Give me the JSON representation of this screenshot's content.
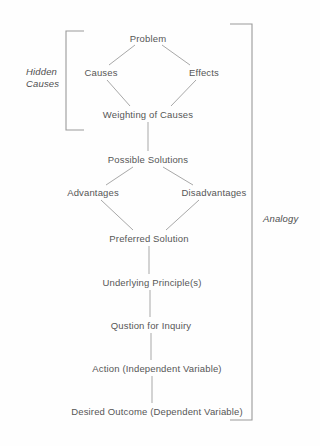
{
  "diagram": {
    "type": "flow-diagram",
    "canvas": {
      "width": 320,
      "height": 446,
      "background": "#fefefe"
    },
    "style": {
      "line_color": "#a8a8a8",
      "bracket_color": "#9a9a9a",
      "text_color": "#565656",
      "group_label_color": "#4f4f4f"
    },
    "nodes": [
      {
        "id": "problem",
        "label": "Problem",
        "x": 148,
        "y": 38
      },
      {
        "id": "causes",
        "label": "Causes",
        "x": 101,
        "y": 72
      },
      {
        "id": "effects",
        "label": "Effects",
        "x": 204,
        "y": 72
      },
      {
        "id": "weighting",
        "label": "Weighting of Causes",
        "x": 148,
        "y": 114
      },
      {
        "id": "possible",
        "label": "Possible Solutions",
        "x": 148,
        "y": 159
      },
      {
        "id": "advantages",
        "label": "Advantages",
        "x": 93,
        "y": 192
      },
      {
        "id": "disadvantages",
        "label": "Disadvantages",
        "x": 214,
        "y": 192
      },
      {
        "id": "preferred",
        "label": "Preferred Solution",
        "x": 149,
        "y": 238
      },
      {
        "id": "underlying",
        "label": "Underlying Principle(s)",
        "x": 152,
        "y": 282
      },
      {
        "id": "question",
        "label": "Qustion for Inquiry",
        "x": 151,
        "y": 325
      },
      {
        "id": "action",
        "label": "Action (Independent Variable)",
        "x": 157,
        "y": 368
      },
      {
        "id": "outcome",
        "label": "Desired Outcome (Dependent Variable)",
        "x": 157,
        "y": 411
      }
    ],
    "connectors": [
      {
        "from": "problem",
        "to": "causes",
        "x1": 135,
        "y1": 45,
        "x2": 109,
        "y2": 65
      },
      {
        "from": "problem",
        "to": "effects",
        "x1": 162,
        "y1": 45,
        "x2": 190,
        "y2": 65
      },
      {
        "from": "causes",
        "to": "weighting",
        "x1": 107,
        "y1": 80,
        "x2": 130,
        "y2": 106
      },
      {
        "from": "effects",
        "to": "weighting",
        "x1": 196,
        "y1": 80,
        "x2": 171,
        "y2": 106
      },
      {
        "from": "weighting",
        "to": "possible",
        "x1": 148,
        "y1": 122,
        "x2": 148,
        "y2": 151
      },
      {
        "from": "possible",
        "to": "advantages",
        "x1": 133,
        "y1": 167,
        "x2": 106,
        "y2": 185
      },
      {
        "from": "possible",
        "to": "disadvantages",
        "x1": 163,
        "y1": 167,
        "x2": 193,
        "y2": 185
      },
      {
        "from": "advantages",
        "to": "preferred",
        "x1": 101,
        "y1": 200,
        "x2": 133,
        "y2": 230
      },
      {
        "from": "disadvantages",
        "to": "preferred",
        "x1": 199,
        "y1": 200,
        "x2": 166,
        "y2": 230
      },
      {
        "from": "preferred",
        "to": "underlying",
        "x1": 149,
        "y1": 246,
        "x2": 149,
        "y2": 274
      },
      {
        "from": "underlying",
        "to": "question",
        "x1": 150,
        "y1": 290,
        "x2": 150,
        "y2": 317
      },
      {
        "from": "question",
        "to": "action",
        "x1": 151,
        "y1": 333,
        "x2": 151,
        "y2": 360
      },
      {
        "from": "action",
        "to": "outcome",
        "x1": 152,
        "y1": 376,
        "x2": 152,
        "y2": 403
      }
    ],
    "brackets": [
      {
        "id": "hidden-causes-bracket",
        "orientation": "left",
        "spine_x": 66,
        "top_y": 31,
        "bottom_y": 130,
        "arm_length": 18
      },
      {
        "id": "analogy-bracket",
        "orientation": "right",
        "spine_x": 252,
        "top_y": 24,
        "bottom_y": 420,
        "arm_length": 22
      }
    ],
    "group_labels": [
      {
        "id": "hidden-causes",
        "lines": [
          "Hidden",
          "Causes"
        ],
        "line1": "Hidden",
        "line2": "Causes",
        "x": 26,
        "y": 66,
        "italic": true,
        "covers": "hidden-causes-bracket"
      },
      {
        "id": "analogy",
        "lines": [
          "Analogy"
        ],
        "line1": "Analogy",
        "x": 263,
        "y": 213,
        "italic": true,
        "covers": "analogy-bracket"
      }
    ]
  }
}
